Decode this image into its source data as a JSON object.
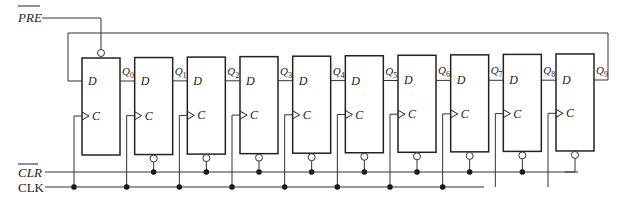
{
  "signals": {
    "preset": "PRE",
    "clear": "CLR",
    "clock": "CLK"
  },
  "flipflops": [
    {
      "d": "D",
      "c": "C",
      "q": "Q",
      "sub": "0"
    },
    {
      "d": "D",
      "c": "C",
      "q": "Q",
      "sub": "1"
    },
    {
      "d": "D",
      "c": "C",
      "q": "Q",
      "sub": "2"
    },
    {
      "d": "D",
      "c": "C",
      "q": "Q",
      "sub": "3"
    },
    {
      "d": "D",
      "c": "C",
      "q": "Q",
      "sub": "4"
    },
    {
      "d": "D",
      "c": "C",
      "q": "Q",
      "sub": "5"
    },
    {
      "d": "D",
      "c": "C",
      "q": "Q",
      "sub": "6"
    },
    {
      "d": "D",
      "c": "C",
      "q": "Q",
      "sub": "7"
    },
    {
      "d": "D",
      "c": "C",
      "q": "Q",
      "sub": "8"
    },
    {
      "d": "D",
      "c": "C",
      "q": "Q",
      "sub": "9"
    }
  ],
  "colors": {
    "line": "#333333",
    "dot": "#111111"
  }
}
